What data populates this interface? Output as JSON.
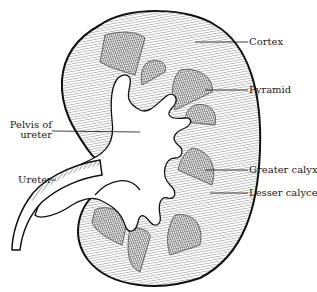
{
  "diagram": {
    "colors": {
      "ink": "#111111",
      "background": "#ffffff"
    },
    "labels": [
      {
        "id": "cortex",
        "text": "Cortex"
      },
      {
        "id": "pyramid",
        "text": "Pyramid"
      },
      {
        "id": "pelvis",
        "text": "Pelvis of",
        "text2": "ureter"
      },
      {
        "id": "ureter",
        "text": "Ureter"
      },
      {
        "id": "greater-calyx",
        "text": "Greater calyx"
      },
      {
        "id": "lesser-calyces",
        "text": "Lesser calyces"
      }
    ]
  }
}
